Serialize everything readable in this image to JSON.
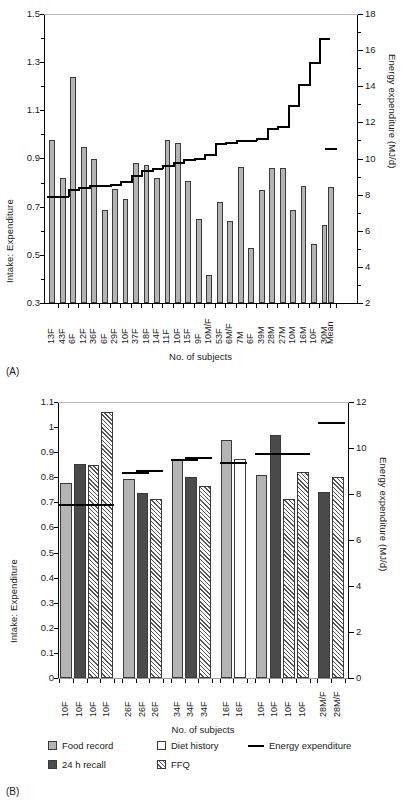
{
  "figure": {
    "panelA_label": "(A)",
    "panelB_label": "(B)"
  },
  "chart_data": [
    {
      "id": "panelA",
      "type": "bar",
      "title": "",
      "xlabel": "No. of subjects",
      "ylabel": "Intake: Expenditure",
      "y2label": "Energy expenditure (MJ/d)",
      "ylim": [
        0.3,
        1.5
      ],
      "yticks": [
        "0.3",
        "0.5",
        "0.7",
        "0.9",
        "1.1",
        "1.3",
        "1.5"
      ],
      "y2lim": [
        2,
        18
      ],
      "y2ticks": [
        "2",
        "4",
        "6",
        "8",
        "10",
        "12",
        "14",
        "16",
        "18"
      ],
      "grid": false,
      "legend": "none",
      "categories": [
        "13F",
        "43F",
        "6F",
        "12F",
        "36F",
        "6F",
        "29F",
        "10F",
        "37F",
        "18F",
        "14F",
        "11F",
        "10F",
        "15F",
        "9F",
        "10M/F",
        "53F",
        "6M/F",
        "7M",
        "6F",
        "39M",
        "28M",
        "27M",
        "10M",
        "16M",
        "10F",
        "30M",
        "Mean"
      ],
      "series": [
        {
          "name": "Intake:Expenditure ratio",
          "values": [
            0.975,
            0.82,
            1.24,
            0.95,
            0.9,
            0.685,
            0.775,
            0.73,
            0.88,
            0.872,
            0.82,
            0.975,
            0.965,
            0.805,
            0.65,
            0.415,
            0.72,
            0.64,
            0.865,
            0.53,
            0.77,
            0.86,
            0.86,
            0.685,
            0.785,
            0.545,
            0.625,
            0.78
          ]
        },
        {
          "name": "Energy expenditure (MJ/d)",
          "values": [
            7.95,
            7.95,
            8.3,
            8.4,
            8.55,
            8.55,
            8.6,
            8.75,
            9.1,
            9.35,
            9.5,
            9.65,
            9.8,
            9.95,
            10.05,
            10.25,
            10.85,
            10.9,
            11.0,
            11.05,
            11.15,
            11.7,
            11.8,
            12.95,
            14.1,
            15.35,
            16.7,
            10.6
          ]
        }
      ]
    },
    {
      "id": "panelB",
      "type": "bar",
      "title": "",
      "xlabel": "No. of subjects",
      "ylabel": "Intake: Expenditure",
      "y2label": "Energy expenditure (MJ/d)",
      "ylim": [
        0,
        1.1
      ],
      "yticks": [
        "0",
        "0.1",
        "0.2",
        "0.3",
        "0.4",
        "0.5",
        "0.6",
        "0.7",
        "0.8",
        "0.9",
        "1",
        "1.1"
      ],
      "y2lim": [
        0,
        12
      ],
      "y2ticks": [
        "0",
        "2",
        "4",
        "6",
        "8",
        "10",
        "12"
      ],
      "grid": false,
      "legend": "bottom",
      "legend_entries": [
        {
          "key": "food-record",
          "label": "Food record",
          "style": "light"
        },
        {
          "key": "recall-24h",
          "label": "24 h recall",
          "style": "dark"
        },
        {
          "key": "diet-history",
          "label": "Diet history",
          "style": "white"
        },
        {
          "key": "ffq",
          "label": "FFQ",
          "style": "hatch"
        },
        {
          "key": "energy-expenditure",
          "label": "Energy expenditure",
          "style": "line"
        }
      ],
      "groups": [
        {
          "name": "group-1",
          "labels": [
            "10F",
            "10F",
            "10F",
            "10F"
          ],
          "bars": [
            {
              "method": "food-record",
              "value": 0.778
            },
            {
              "method": "recall-24h",
              "value": 0.852
            },
            {
              "method": "ffq",
              "value": 0.85
            },
            {
              "method": "ffq",
              "value": 1.06
            }
          ],
          "ee_segments": [
            {
              "from": 0,
              "to": 3,
              "value": 0.692
            }
          ]
        },
        {
          "name": "group-2",
          "labels": [
            "26F",
            "26F",
            "26F"
          ],
          "bars": [
            {
              "method": "food-record",
              "value": 0.792
            },
            {
              "method": "recall-24h",
              "value": 0.739
            },
            {
              "method": "ffq",
              "value": 0.714
            }
          ],
          "ee_segments": [
            {
              "from": 0,
              "to": 1,
              "value": 0.82
            },
            {
              "from": 1,
              "to": 2,
              "value": 0.83
            }
          ]
        },
        {
          "name": "group-3",
          "labels": [
            "34F",
            "34F",
            "34F"
          ],
          "bars": [
            {
              "method": "food-record",
              "value": 0.87
            },
            {
              "method": "recall-24h",
              "value": 0.803
            },
            {
              "method": "ffq",
              "value": 0.766
            }
          ],
          "ee_segments": [
            {
              "from": 0,
              "to": 1,
              "value": 0.872
            },
            {
              "from": 1,
              "to": 2,
              "value": 0.88
            }
          ]
        },
        {
          "name": "group-4",
          "labels": [
            "16F",
            "16F"
          ],
          "bars": [
            {
              "method": "food-record",
              "value": 0.95
            },
            {
              "method": "diet-history",
              "value": 0.875
            }
          ],
          "ee_segments": [
            {
              "from": 0,
              "to": 1,
              "value": 0.862
            }
          ]
        },
        {
          "name": "group-5",
          "labels": [
            "10F",
            "10F",
            "10F",
            "10F"
          ],
          "bars": [
            {
              "method": "food-record",
              "value": 0.808
            },
            {
              "method": "recall-24h",
              "value": 0.968
            },
            {
              "method": "ffq",
              "value": 0.714
            },
            {
              "method": "ffq",
              "value": 0.82
            }
          ],
          "ee_segments": [
            {
              "from": 0,
              "to": 3,
              "value": 0.897
            }
          ]
        },
        {
          "name": "group-6",
          "labels": [
            "28M/F",
            "28M/F"
          ],
          "bars": [
            {
              "method": "recall-24h",
              "value": 0.741
            },
            {
              "method": "ffq",
              "value": 0.803
            }
          ],
          "ee_segments": [
            {
              "from": 0,
              "to": 1,
              "value": 1.022
            }
          ]
        }
      ]
    }
  ]
}
